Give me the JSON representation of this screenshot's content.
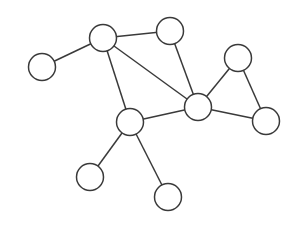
{
  "diagram": {
    "type": "undirected-graph",
    "style": {
      "stroke_color": "#3a3a3a",
      "node_fill": "#ffffff",
      "background": "#ffffff",
      "node_radius": 13.5
    },
    "nodes": [
      {
        "id": "A",
        "x": 42,
        "y": 67
      },
      {
        "id": "B",
        "x": 103,
        "y": 38
      },
      {
        "id": "C",
        "x": 170,
        "y": 31
      },
      {
        "id": "D",
        "x": 238,
        "y": 58
      },
      {
        "id": "E",
        "x": 198,
        "y": 107
      },
      {
        "id": "F",
        "x": 130,
        "y": 122
      },
      {
        "id": "G",
        "x": 90,
        "y": 177
      },
      {
        "id": "H",
        "x": 168,
        "y": 197
      },
      {
        "id": "I",
        "x": 266,
        "y": 121
      }
    ],
    "edges": [
      [
        "A",
        "B"
      ],
      [
        "B",
        "C"
      ],
      [
        "B",
        "E"
      ],
      [
        "B",
        "F"
      ],
      [
        "C",
        "E"
      ],
      [
        "E",
        "D"
      ],
      [
        "D",
        "I"
      ],
      [
        "E",
        "I"
      ],
      [
        "E",
        "F"
      ],
      [
        "F",
        "G"
      ],
      [
        "F",
        "H"
      ]
    ]
  }
}
